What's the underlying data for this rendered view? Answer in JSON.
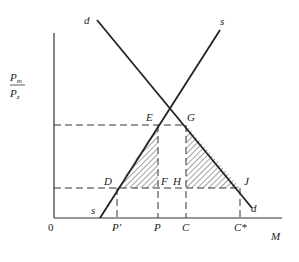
{
  "diagram": {
    "y_axis_label_num": "Pm",
    "y_axis_label_num_base": "P",
    "y_axis_label_num_sub": "m",
    "y_axis_label_den_base": "P",
    "y_axis_label_den_sub": "z",
    "x_axis_label": "M",
    "origin": "0",
    "curves": {
      "demand_top": "d",
      "demand_bottom": "d",
      "supply_top": "s",
      "supply_bottom": "s"
    },
    "points": {
      "E": "E",
      "G": "G",
      "D": "D",
      "F": "F",
      "H": "H",
      "J": "J"
    },
    "x_ticks": [
      "P′",
      "P",
      "C",
      "C*"
    ]
  }
}
